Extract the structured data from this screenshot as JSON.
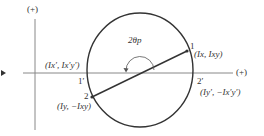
{
  "diagram": {
    "vertical_axis_label": "(+)",
    "horizontal_axis_label": "(+)",
    "angle_label": "2θp",
    "points": [
      {
        "id": "1",
        "label": "1",
        "coords": "(Ix, Ixy)"
      },
      {
        "id": "2",
        "label": "2",
        "coords": "(Iy, −Ixy)"
      },
      {
        "id": "1p",
        "label": "1′",
        "coords": "(Ix′, Ix′y′)"
      },
      {
        "id": "2p",
        "label": "2′",
        "coords": "(Iy′, −Ix′y′)"
      }
    ],
    "left_marker": "▸",
    "colors": {
      "line": "#333333",
      "axis": "#888888"
    }
  }
}
